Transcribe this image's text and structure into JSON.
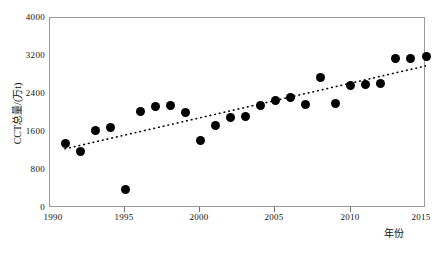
{
  "chart_data": {
    "type": "scatter",
    "title": "",
    "xlabel": "年份",
    "ylabel": "CCT总量/(万t)",
    "xlim": [
      1990,
      2015
    ],
    "ylim": [
      0,
      4000
    ],
    "xticks": [
      1990,
      1995,
      2000,
      2005,
      2010,
      2015
    ],
    "yticks": [
      0,
      800,
      1600,
      2400,
      3200,
      4000
    ],
    "xtick_labels": [
      "1990",
      "1995",
      "2000",
      "2005",
      "2010",
      "2015"
    ],
    "ytick_labels": [
      "0",
      "800",
      "1600",
      "2400",
      "3200",
      "4000"
    ],
    "grid": false,
    "legend": null,
    "marker": "filled-circle",
    "marker_color": "#000000",
    "x": [
      1991,
      1992,
      1993,
      1994,
      1995,
      1996,
      1997,
      1998,
      1999,
      2000,
      2001,
      2002,
      2003,
      2004,
      2005,
      2006,
      2007,
      2008,
      2009,
      2010,
      2011,
      2012,
      2013,
      2014,
      2015
    ],
    "values": [
      1360,
      1200,
      1630,
      1700,
      390,
      2030,
      2130,
      2160,
      2010,
      1430,
      1730,
      1900,
      1920,
      2160,
      2260,
      2330,
      2180,
      2750,
      2190,
      2570,
      2600,
      2630,
      3150,
      3150,
      3180
    ],
    "series": [
      {
        "name": "CCT总量",
        "values": [
          1360,
          1200,
          1630,
          1700,
          390,
          2030,
          2130,
          2160,
          2010,
          1430,
          1730,
          1900,
          1920,
          2160,
          2260,
          2330,
          2180,
          2750,
          2190,
          2570,
          2600,
          2630,
          3150,
          3150,
          3180
        ]
      }
    ],
    "trendline": {
      "style": "dotted",
      "color": "#000000",
      "slope": 72.78,
      "intercept": -143659,
      "equation": "y=72.78x−143659",
      "r_squared": "R²=0.73",
      "x_start": 1991,
      "x_end": 2015
    },
    "annotations": {
      "equation": "y=72.78x−143659",
      "r_squared": "R²=0.73"
    }
  },
  "axes": {
    "y_title": "CCT总量/(万t)",
    "x_title": "年份"
  }
}
